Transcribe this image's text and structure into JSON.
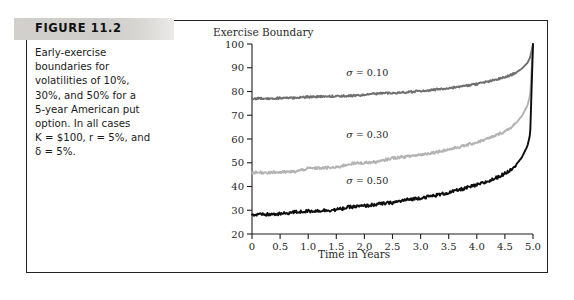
{
  "figure": {
    "header_label": "FIGURE 11.2",
    "caption_lines": [
      "Early-exercise",
      "boundaries for",
      "volatilities of 10%,",
      "30%, and 50% for a",
      "5-year American put",
      "option.  In all cases"
    ],
    "caption_line_k": "K = $100, r = 5%, and",
    "caption_line_delta": "δ = 5%."
  },
  "chart_data": {
    "type": "line",
    "title": "",
    "ylabel": "Exercise Boundary",
    "xlabel": "Time in Years",
    "xlim": [
      0,
      5
    ],
    "ylim": [
      20,
      100
    ],
    "grid": false,
    "legend": "inline-annotations",
    "xticks": [
      "0",
      "0.5",
      "1.0",
      "1.5",
      "2.0",
      "2.5",
      "3.0",
      "3.5",
      "4.0",
      "4.5",
      "5.0"
    ],
    "xtick_values": [
      0,
      0.5,
      1.0,
      1.5,
      2.0,
      2.5,
      3.0,
      3.5,
      4.0,
      4.5,
      5.0
    ],
    "yticks": [
      "20",
      "30",
      "40",
      "50",
      "60",
      "70",
      "80",
      "90",
      "100"
    ],
    "ytick_values": [
      20,
      30,
      40,
      50,
      60,
      70,
      80,
      90,
      100
    ],
    "x": [
      0,
      0.25,
      0.5,
      0.75,
      1.0,
      1.25,
      1.5,
      1.75,
      2.0,
      2.25,
      2.5,
      2.75,
      3.0,
      3.25,
      3.5,
      3.75,
      4.0,
      4.25,
      4.5,
      4.6,
      4.7,
      4.8,
      4.9,
      4.95,
      5.0
    ],
    "series": [
      {
        "name": "sigma = 0.10",
        "label": "σ = 0.10",
        "color": "#6e6e6e",
        "label_x": 2.05,
        "label_y": 86.5,
        "values": [
          77.0,
          77.1,
          77.2,
          77.3,
          77.8,
          77.9,
          78.0,
          78.2,
          78.5,
          79.2,
          79.4,
          79.7,
          80.2,
          80.8,
          81.4,
          82.2,
          83.2,
          84.4,
          86.0,
          86.9,
          88.0,
          89.6,
          92.0,
          94.4,
          100.0
        ]
      },
      {
        "name": "sigma = 0.30",
        "label": "σ = 0.30",
        "color": "#b3b3b3",
        "label_x": 2.05,
        "label_y": 60.5,
        "values": [
          45.8,
          45.9,
          46.0,
          46.2,
          47.6,
          47.8,
          48.0,
          49.6,
          50.0,
          50.4,
          52.0,
          52.6,
          53.4,
          54.4,
          55.6,
          57.0,
          58.6,
          60.6,
          63.2,
          64.8,
          66.8,
          69.6,
          74.0,
          78.5,
          100.0
        ]
      },
      {
        "name": "sigma = 0.50",
        "label": "σ = 0.50",
        "color": "#0d0d0d",
        "label_x": 2.05,
        "label_y": 41.0,
        "values": [
          28.0,
          28.2,
          28.4,
          29.2,
          29.6,
          29.9,
          30.2,
          31.4,
          31.8,
          32.6,
          33.2,
          34.4,
          35.2,
          36.2,
          37.4,
          39.0,
          40.6,
          42.6,
          45.4,
          47.0,
          49.2,
          52.2,
          57.0,
          62.0,
          100.0
        ]
      }
    ]
  }
}
